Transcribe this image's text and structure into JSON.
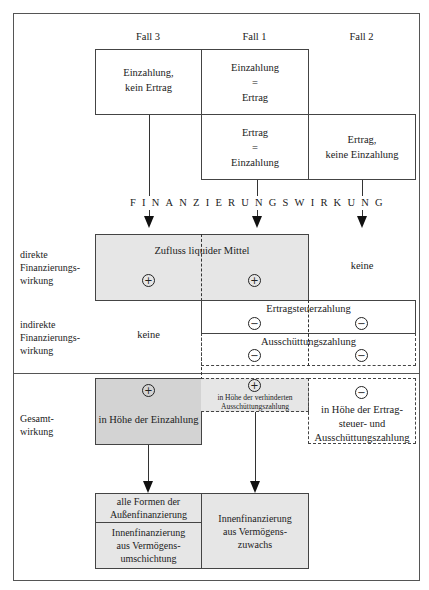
{
  "columns": {
    "fall3": "Fall 3",
    "fall1": "Fall 1",
    "fall2": "Fall 2"
  },
  "top_boxes": {
    "fall3": [
      "Einzahlung,",
      "kein Ertrag"
    ],
    "fall1_top": [
      "Einzahlung",
      "=",
      "Ertrag"
    ],
    "fall1_bottom": [
      "Ertrag",
      "=",
      "Einzahlung"
    ],
    "fall2": [
      "Ertrag,",
      "keine Einzahlung"
    ]
  },
  "banner": "FINANZIERUNGSWIRKUNG",
  "rows": {
    "direct": {
      "label": [
        "direkte",
        "Finanzierungs-",
        "wirkung"
      ],
      "box_title": "Zufluss liquider Mittel",
      "fall3_sign": "+",
      "fall1_sign": "+",
      "fall2_text": "keine"
    },
    "indirect": {
      "label": [
        "indirekte",
        "Finanzierungs-",
        "wirkung"
      ],
      "fall3_text": "keine",
      "tax_title": "Ertragsteuerzahlung",
      "tax_signs": [
        "−",
        "−"
      ],
      "dividend_title": "Ausschüttungszahlung",
      "dividend_signs": [
        "−",
        "−"
      ]
    },
    "total": {
      "label": [
        "Gesamt-",
        "wirkung"
      ],
      "fall3_sign": "+",
      "fall3_text": "in Höhe der Einzahlung",
      "fall1_sign": "+",
      "fall1_text": [
        "in Höhe der verhinderten",
        "Ausschüttungszahlung"
      ],
      "fall2_sign": "−",
      "fall2_text": [
        "in Höhe der Ertrag-",
        "steuer- und",
        "Ausschüttungszahlung"
      ]
    }
  },
  "results": {
    "external_top": [
      "alle Formen der",
      "Außenfinanzierung"
    ],
    "external_bottom": [
      "Innenfinanzierung",
      "aus Vermögens-",
      "umschichtung"
    ],
    "internal": [
      "Innenfinanzierung",
      "aus Vermögens-",
      "zuwachs"
    ]
  },
  "colors": {
    "light_gray": "#e6e6e6",
    "dark_gray": "#d3d3d3",
    "line": "#444444"
  }
}
